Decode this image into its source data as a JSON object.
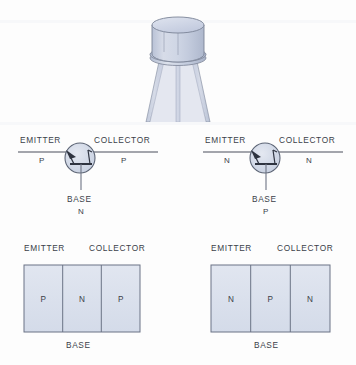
{
  "figure": {
    "background_color": "#fdfdfd",
    "ink_color": "#3b3f49",
    "fill_color": "#dde3ee",
    "fill_color_dark": "#ccd4e4",
    "outline_color": "#6b7385"
  },
  "photo": {
    "name": "transistor-can-photo",
    "description": "TO-18 metal can transistor with three leads",
    "body_color": "#c9d1e2",
    "highlight_color": "#dfe4ef",
    "shadow_color": "#b3bcd0",
    "outline_color": "#7b8396"
  },
  "symbols": [
    {
      "id": "pnp",
      "type": "PNP",
      "emitter_label": "EMITTER",
      "emitter_type": "P",
      "collector_label": "COLLECTOR",
      "collector_type": "P",
      "base_label": "BASE",
      "base_type": "N",
      "arrow_direction": "in-toward-base"
    },
    {
      "id": "npn",
      "type": "NPN",
      "emitter_label": "EMITTER",
      "emitter_type": "N",
      "collector_label": "COLLECTOR",
      "collector_type": "N",
      "base_label": "BASE",
      "base_type": "P",
      "arrow_direction": "in-toward-base"
    }
  ],
  "blocks": [
    {
      "id": "pnp-block",
      "emitter_label": "EMITTER",
      "collector_label": "COLLECTOR",
      "base_label": "BASE",
      "zones": [
        "P",
        "N",
        "P"
      ]
    },
    {
      "id": "npn-block",
      "emitter_label": "EMITTER",
      "collector_label": "COLLECTOR",
      "base_label": "BASE",
      "zones": [
        "N",
        "P",
        "N"
      ]
    }
  ]
}
